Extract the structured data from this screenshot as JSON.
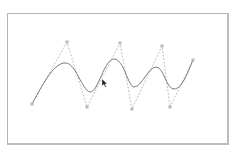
{
  "diagram": {
    "type": "spline-with-control-polygon",
    "frame": {
      "x": 7,
      "y": 13,
      "width": 222,
      "height": 132,
      "border_color": "#b4b4b4"
    },
    "control_points": [
      {
        "x": 32,
        "y": 104
      },
      {
        "x": 67,
        "y": 42
      },
      {
        "x": 87,
        "y": 107
      },
      {
        "x": 120,
        "y": 43
      },
      {
        "x": 132,
        "y": 109
      },
      {
        "x": 162,
        "y": 46
      },
      {
        "x": 170,
        "y": 107
      },
      {
        "x": 193,
        "y": 60
      }
    ],
    "curve_path": "M32,104 C45,80 55,62 66,63 C76,64 82,90 90,92 C98,93 104,59 114,59 C124,59 128,87 134,87 C142,87 148,67 156,67 C164,67 166,89 174,89 C182,89 188,72 193,60",
    "colors": {
      "curve": "#7a7a7a",
      "control_polygon": "#b0b0b0",
      "control_point": "#b8b8b8",
      "cursor": "#222222"
    },
    "cursor": {
      "x": 102,
      "y": 79,
      "icon": "mouse-pointer-icon"
    }
  }
}
